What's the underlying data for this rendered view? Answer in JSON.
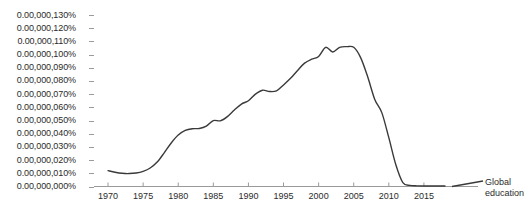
{
  "chart_data": {
    "type": "line",
    "title": "",
    "xlabel": "",
    "ylabel": "",
    "grid": false,
    "legend_position": "right-inline",
    "xlim": [
      1968,
      2019
    ],
    "ylim": [
      0,
      1.3e-07
    ],
    "y_tick_labels": [
      "0.00,000,130%",
      "0.00,000,120%",
      "0.00,000,110%",
      "0.00,000,100%",
      "0.00,000,090%",
      "0.00,000,080%",
      "0.00,000,070%",
      "0.00,000,060%",
      "0.00,000,050%",
      "0.00,000,040%",
      "0.00,000,030%",
      "0.00,000,020%",
      "0.00,000,010%",
      "0.00,000,000%"
    ],
    "y_tick_values": [
      1.3e-07,
      1.2e-07,
      1.1e-07,
      1e-07,
      9e-08,
      8e-08,
      7e-08,
      6e-08,
      5e-08,
      4e-08,
      3e-08,
      2e-08,
      1e-08,
      0
    ],
    "x_tick_labels": [
      "1970",
      "1975",
      "1980",
      "1985",
      "1990",
      "1995",
      "2000",
      "2005",
      "2010",
      "2015"
    ],
    "x_tick_values": [
      1970,
      1975,
      1980,
      1985,
      1990,
      1995,
      2000,
      2005,
      2010,
      2015
    ],
    "series": [
      {
        "name": "Global education",
        "color": "#3a3a3a",
        "x": [
          1970,
          1971,
          1972,
          1973,
          1974,
          1975,
          1976,
          1977,
          1978,
          1979,
          1980,
          1981,
          1982,
          1983,
          1984,
          1985,
          1986,
          1987,
          1988,
          1989,
          1990,
          1991,
          1992,
          1993,
          1994,
          1995,
          1996,
          1997,
          1998,
          1999,
          2000,
          2001,
          2002,
          2003,
          2004,
          2005,
          2006,
          2007,
          2008,
          2009,
          2010,
          2011,
          2012,
          2013,
          2014,
          2015,
          2016,
          2017,
          2018
        ],
        "values": [
          1.2e-08,
          1.08e-08,
          1e-08,
          9.8e-09,
          1.02e-08,
          1.15e-08,
          1.4e-08,
          1.85e-08,
          2.55e-08,
          3.3e-08,
          3.9e-08,
          4.25e-08,
          4.38e-08,
          4.4e-08,
          4.58e-08,
          5e-08,
          4.98e-08,
          5.3e-08,
          5.8e-08,
          6.25e-08,
          6.5e-08,
          7e-08,
          7.3e-08,
          7.2e-08,
          7.25e-08,
          7.7e-08,
          8.2e-08,
          8.8e-08,
          9.35e-08,
          9.65e-08,
          9.85e-08,
          1.055e-07,
          1.02e-07,
          1.055e-07,
          1.06e-07,
          1.055e-07,
          9.75e-08,
          8.3e-08,
          6.6e-08,
          5.6e-08,
          3.7e-08,
          1.65e-08,
          3e-09,
          8e-10,
          5e-10,
          4e-10,
          4e-10,
          4e-10,
          4e-10
        ]
      }
    ]
  },
  "legend": {
    "line1": "Global",
    "line2": "education"
  }
}
